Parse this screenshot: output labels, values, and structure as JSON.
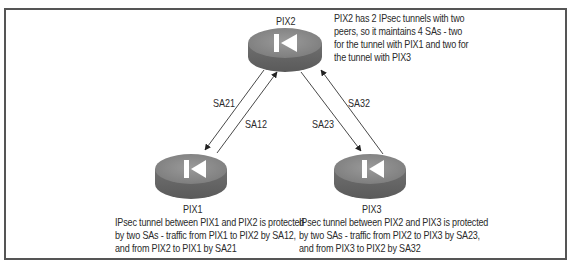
{
  "diagram": {
    "type": "network-ipsec-security-associations",
    "nodes": [
      {
        "id": "pix2",
        "label": "PIX2",
        "icon": "firewall-router-icon"
      },
      {
        "id": "pix1",
        "label": "PIX1",
        "icon": "firewall-router-icon"
      },
      {
        "id": "pix3",
        "label": "PIX3",
        "icon": "firewall-router-icon"
      }
    ],
    "edges": [
      {
        "id": "sa21",
        "label": "SA21",
        "from": "PIX2",
        "to": "PIX1"
      },
      {
        "id": "sa12",
        "label": "SA12",
        "from": "PIX1",
        "to": "PIX2"
      },
      {
        "id": "sa23",
        "label": "SA23",
        "from": "PIX2",
        "to": "PIX3"
      },
      {
        "id": "sa32",
        "label": "SA32",
        "from": "PIX3",
        "to": "PIX2"
      }
    ],
    "notes": {
      "pix2": [
        "PIX2 has 2 IPsec tunnels with two",
        "peers, so it maintains 4 SAs - two",
        "for the tunnel with PIX1 and two for",
        "the tunnel with PIX3"
      ],
      "pix1": [
        "IPsec tunnel between PIX1 and PIX2 is protected",
        "by two SAs - traffic from PIX1 to PIX2 by SA12,",
        "and from PIX2 to PIX1 by SA21"
      ],
      "pix3": [
        "IPsec tunnel between PIX2 and PIX3 is protected",
        "by two SAs - traffic from PIX2 to PIX3 by SA23,",
        "and from PIX3 to PIX2 by SA32"
      ]
    },
    "colors": {
      "router_top": "#8a8a8a",
      "router_side": "#6a6a6a",
      "router_glyph": "#ffffff",
      "arrow": "#333333",
      "border": "#555555"
    }
  }
}
